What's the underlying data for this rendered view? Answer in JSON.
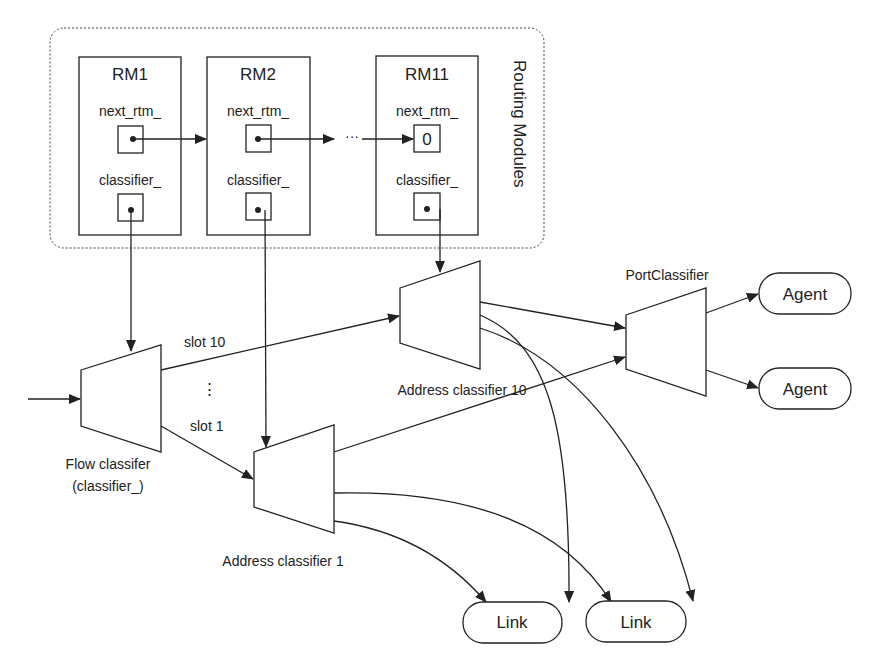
{
  "group": {
    "label": "Routing Modules"
  },
  "routing_modules": [
    {
      "title": "RM1",
      "field1": "next_rtm_",
      "field2": "classifier_",
      "next_value": ""
    },
    {
      "title": "RM2",
      "field1": "next_rtm_",
      "field2": "classifier_",
      "next_value": ""
    },
    {
      "title": "RM11",
      "field1": "next_rtm_",
      "field2": "classifier_",
      "next_value": "0"
    }
  ],
  "chain_ellipsis": "···",
  "classifiers": {
    "flow": {
      "line1": "Flow classifer",
      "line2": "(classifier_)"
    },
    "addr10": {
      "label": "Address classifier 10"
    },
    "addr1": {
      "label": "Address classifier 1"
    },
    "port": {
      "label": "PortClassifier"
    }
  },
  "slots": {
    "top": "slot 10",
    "bottom": "slot 1",
    "ellipsis": "⋮"
  },
  "endpoints": {
    "agents": [
      "Agent",
      "Agent"
    ],
    "links": [
      "Link",
      "Link"
    ]
  },
  "colors": {
    "line": "#222222",
    "background": "#ffffff"
  }
}
